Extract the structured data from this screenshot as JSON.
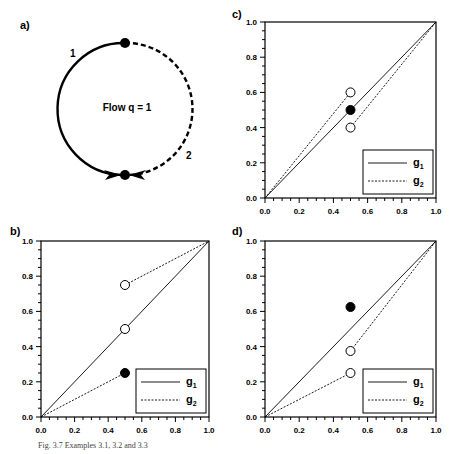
{
  "figure": {
    "caption": "Fig. 3.7  Examples 3.1, 3.2 and 3.3"
  },
  "panel_a": {
    "label": "a)",
    "center_text": "Flow q = 1",
    "arc_labels": [
      "1",
      "2"
    ],
    "arc_styles": [
      "solid",
      "dashed"
    ]
  },
  "chart_data": [
    {
      "panel": "b)",
      "type": "line",
      "xlim": [
        0,
        1
      ],
      "ylim": [
        0,
        1
      ],
      "xticks": [
        "0.0",
        "0.2",
        "0.4",
        "0.6",
        "0.8",
        "1.0"
      ],
      "yticks": [
        "0.0",
        "0.2",
        "0.4",
        "0.6",
        "0.8",
        "1.0"
      ],
      "legend": [
        "g1",
        "g2"
      ],
      "legend_position": "lower right",
      "series": [
        {
          "name": "g1",
          "style": "solid",
          "segments": [
            [
              [
                0,
                0
              ],
              [
                0.5,
                0.5
              ]
            ],
            [
              [
                0.5,
                0.5
              ],
              [
                1,
                1
              ]
            ]
          ]
        },
        {
          "name": "g2",
          "style": "dashed",
          "segments": [
            [
              [
                0,
                0
              ],
              [
                0.5,
                0.25
              ]
            ],
            [
              [
                0.5,
                0.75
              ],
              [
                1,
                1
              ]
            ]
          ]
        }
      ],
      "points": [
        {
          "x": 0.5,
          "y": 0.75,
          "fill": "open"
        },
        {
          "x": 0.5,
          "y": 0.5,
          "fill": "open"
        },
        {
          "x": 0.5,
          "y": 0.25,
          "fill": "filled"
        }
      ]
    },
    {
      "panel": "c)",
      "type": "line",
      "xlim": [
        0,
        1
      ],
      "ylim": [
        0,
        1
      ],
      "xticks": [
        "0.0",
        "0.2",
        "0.4",
        "0.6",
        "0.8",
        "1.0"
      ],
      "yticks": [
        "0.0",
        "0.2",
        "0.4",
        "0.6",
        "0.8",
        "1.0"
      ],
      "legend": [
        "g1",
        "g2"
      ],
      "legend_position": "lower right",
      "series": [
        {
          "name": "g1",
          "style": "solid",
          "segments": [
            [
              [
                0,
                0
              ],
              [
                1,
                1
              ]
            ]
          ]
        },
        {
          "name": "g2",
          "style": "dashed",
          "segments": [
            [
              [
                0,
                0
              ],
              [
                0.5,
                0.6
              ]
            ],
            [
              [
                0.5,
                0.4
              ],
              [
                1,
                1
              ]
            ]
          ]
        }
      ],
      "points": [
        {
          "x": 0.5,
          "y": 0.6,
          "fill": "open"
        },
        {
          "x": 0.5,
          "y": 0.5,
          "fill": "filled"
        },
        {
          "x": 0.5,
          "y": 0.4,
          "fill": "open"
        }
      ]
    },
    {
      "panel": "d)",
      "type": "line",
      "xlim": [
        0,
        1
      ],
      "ylim": [
        0,
        1
      ],
      "xticks": [
        "0.0",
        "0.2",
        "0.4",
        "0.6",
        "0.8",
        "1.0"
      ],
      "yticks": [
        "0.0",
        "0.2",
        "0.4",
        "0.6",
        "0.8",
        "1.0"
      ],
      "legend": [
        "g1",
        "g2"
      ],
      "legend_position": "lower right",
      "series": [
        {
          "name": "g1",
          "style": "solid",
          "segments": [
            [
              [
                0,
                0
              ],
              [
                1,
                1
              ]
            ]
          ]
        },
        {
          "name": "g2",
          "style": "dashed",
          "segments": [
            [
              [
                0,
                0
              ],
              [
                0.5,
                0.25
              ]
            ],
            [
              [
                0.5,
                0.375
              ],
              [
                1,
                1
              ]
            ]
          ]
        }
      ],
      "points": [
        {
          "x": 0.5,
          "y": 0.625,
          "fill": "filled"
        },
        {
          "x": 0.5,
          "y": 0.375,
          "fill": "open"
        },
        {
          "x": 0.5,
          "y": 0.25,
          "fill": "open"
        }
      ]
    }
  ]
}
